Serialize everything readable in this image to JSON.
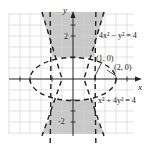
{
  "figure": {
    "type": "graph-of-system-of-inequalities",
    "axes": {
      "x_label": "x",
      "y_label": "y",
      "y_tick_labels": [
        "2",
        "-2"
      ]
    },
    "curves": [
      {
        "equation": "4x² − y² = 4",
        "style": "dashed",
        "kind": "hyperbola"
      },
      {
        "equation": "x² + 4y² = 4",
        "style": "dashed",
        "kind": "ellipse"
      }
    ],
    "points": [
      {
        "label": "(1, 0)"
      },
      {
        "label": "(2, 0)"
      }
    ],
    "colors": {
      "shade": "#c8c8c8",
      "grid": "#d4d4d4",
      "axis": "#222222",
      "curve": "#222222"
    }
  }
}
